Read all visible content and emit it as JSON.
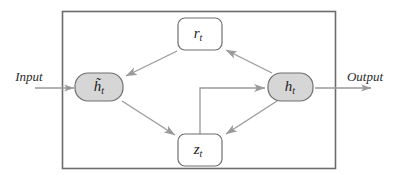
{
  "diagram": {
    "container": {
      "name": "cell-boundary",
      "x": 62,
      "y": 11,
      "width": 273,
      "height": 157,
      "stroke": "#6b6b6b",
      "fill": "#ffffff"
    },
    "colors": {
      "node_fill_gray": "#d6d6d6",
      "node_fill_white": "#ffffff",
      "node_stroke": "#6f6f6f",
      "edge_stroke": "#9a9a9a",
      "border_stroke": "#6b6b6b",
      "text": "#1a1a1a"
    },
    "nodes": [
      {
        "id": "r-t",
        "name": "node-r-t",
        "label": "r",
        "subscript": "t",
        "shape": "rounded-rect",
        "fill": "#ffffff",
        "x": 178,
        "y": 18,
        "width": 44,
        "height": 32,
        "rx": 7
      },
      {
        "id": "h-tilde-t",
        "name": "node-h-tilde-t",
        "label": "h̃",
        "subscript": "t",
        "shape": "stadium",
        "fill": "#d6d6d6",
        "x": 75,
        "y": 73,
        "width": 48,
        "height": 28,
        "rx": 14
      },
      {
        "id": "h-t",
        "name": "node-h-t",
        "label": "h",
        "subscript": "t",
        "shape": "stadium",
        "fill": "#d6d6d6",
        "x": 268,
        "y": 73,
        "width": 45,
        "height": 28,
        "rx": 14
      },
      {
        "id": "z-t",
        "name": "node-z-t",
        "label": "z",
        "subscript": "t",
        "shape": "rounded-rect",
        "fill": "#ffffff",
        "x": 178,
        "y": 134,
        "width": 44,
        "height": 32,
        "rx": 7
      }
    ],
    "edges": [
      {
        "id": "r-to-htilde",
        "name": "edge-r-to-h-tilde",
        "from": "r-t",
        "to": "h-tilde-t",
        "arrow": true
      },
      {
        "id": "ht-to-r",
        "name": "edge-h-to-r",
        "from": "h-t",
        "to": "r-t",
        "arrow": true
      },
      {
        "id": "htilde-to-z",
        "name": "edge-h-tilde-to-z",
        "from": "h-tilde-t",
        "to": "z-t",
        "arrow": true
      },
      {
        "id": "ht-to-z",
        "name": "edge-h-to-z",
        "from": "h-t",
        "to": "z-t",
        "arrow": true
      },
      {
        "id": "z-to-ht",
        "name": "edge-z-to-h",
        "from": "z-t",
        "to": "h-t",
        "arrow": true,
        "style": "elbow"
      }
    ],
    "io": {
      "input": {
        "name": "input-label",
        "label": "Input",
        "label_x": 29,
        "label_y": 78,
        "arrow_from_x": 35,
        "arrow_to_x": 75,
        "arrow_y": 88
      },
      "output": {
        "name": "output-label",
        "label": "Output",
        "label_x": 365,
        "label_y": 78,
        "arrow_from_x": 313,
        "arrow_to_x": 371,
        "arrow_y": 88
      }
    }
  }
}
